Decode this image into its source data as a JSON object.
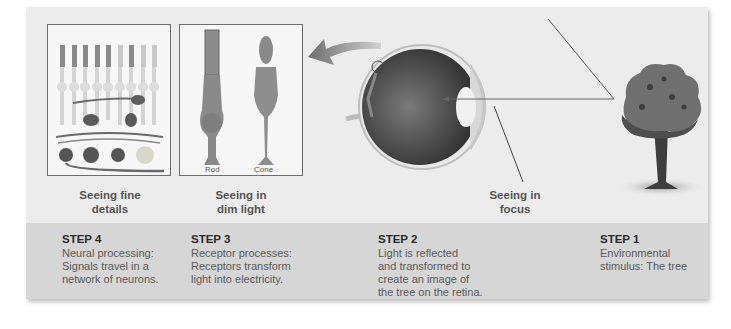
{
  "figure": {
    "captions": {
      "fine_details": "Seeing fine\ndetails",
      "dim_light": "Seeing in\ndim light",
      "focus": "Seeing in\nfocus"
    },
    "receptor_labels": {
      "rod": "Rod",
      "cone": "Cone"
    },
    "steps": [
      {
        "title": "STEP 4",
        "desc": "Neural processing:\nSignals travel in a\nnetwork of neurons."
      },
      {
        "title": "STEP 3",
        "desc": "Receptor processes:\nReceptors transform\nlight into electricity."
      },
      {
        "title": "STEP 2",
        "desc": "Light is reflected\nand transformed to\ncreate an image of\nthe tree on the retina."
      },
      {
        "title": "STEP 1",
        "desc": "Environmental\nstimulus: The tree"
      }
    ],
    "colors": {
      "panel": "#ececec",
      "band": "#d6d6d6",
      "text_dark": "#2a2a2a",
      "text_caption": "#555555"
    }
  }
}
